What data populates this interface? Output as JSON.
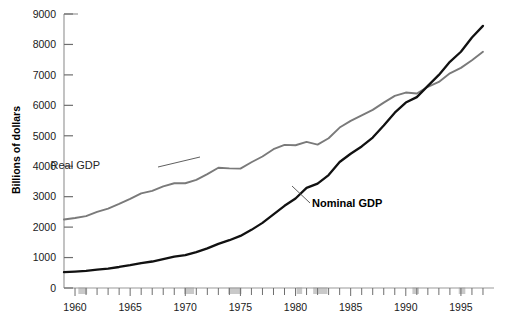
{
  "chart_data": {
    "type": "line",
    "title": "",
    "subtitle": "",
    "xlabel": "",
    "ylabel": "Billions of dollars",
    "xlim": [
      1959,
      1998
    ],
    "ylim": [
      0,
      9000
    ],
    "ytick_values": [
      0,
      1000,
      2000,
      3000,
      4000,
      5000,
      6000,
      7000,
      8000,
      9000
    ],
    "ytick_labels": [
      "0",
      "1000",
      "2000",
      "3000",
      "4000",
      "5000",
      "6000",
      "7000",
      "8000",
      "9000"
    ],
    "xtick_major_values": [
      1960,
      1965,
      1970,
      1975,
      1980,
      1985,
      1990,
      1995
    ],
    "xtick_major_labels": [
      "1960",
      "1965",
      "1970",
      "1975",
      "1980",
      "1985",
      "1990",
      "1995"
    ],
    "xtick_minor_step": 1,
    "grid": false,
    "legend_position": "inline-annotations",
    "x": [
      1959,
      1960,
      1961,
      1962,
      1963,
      1964,
      1965,
      1966,
      1967,
      1968,
      1969,
      1970,
      1971,
      1972,
      1973,
      1974,
      1975,
      1976,
      1977,
      1978,
      1979,
      1980,
      1981,
      1982,
      1983,
      1984,
      1985,
      1986,
      1987,
      1988,
      1989,
      1990,
      1991,
      1992,
      1993,
      1994,
      1995,
      1996,
      1997
    ],
    "series": [
      {
        "name": "Real GDP",
        "color": "#7a7a7a",
        "label_style": "plain",
        "values": [
          2250,
          2300,
          2360,
          2500,
          2610,
          2760,
          2930,
          3110,
          3190,
          3340,
          3440,
          3440,
          3550,
          3740,
          3950,
          3930,
          3920,
          4130,
          4320,
          4560,
          4700,
          4690,
          4800,
          4710,
          4920,
          5270,
          5490,
          5670,
          5850,
          6090,
          6310,
          6420,
          6390,
          6610,
          6770,
          7050,
          7230,
          7480,
          7760
        ]
      },
      {
        "name": "Nominal GDP",
        "color": "#111111",
        "label_style": "bold",
        "values": [
          520,
          540,
          560,
          600,
          640,
          690,
          750,
          820,
          870,
          950,
          1030,
          1080,
          1180,
          1300,
          1450,
          1570,
          1710,
          1910,
          2140,
          2420,
          2700,
          2940,
          3290,
          3430,
          3710,
          4140,
          4410,
          4650,
          4940,
          5340,
          5760,
          6090,
          6270,
          6640,
          7000,
          7430,
          7760,
          8230,
          8610
        ]
      }
    ],
    "annotations": [
      {
        "text": "Real GDP",
        "for_series": "Real GDP",
        "style": "plain",
        "text_x": 100,
        "text_y": 169,
        "leader_from": [
          158,
          167
        ],
        "leader_to": [
          200,
          157
        ]
      },
      {
        "text": "Nominal GDP",
        "for_series": "Nominal GDP",
        "style": "bold",
        "text_x": 312,
        "text_y": 207,
        "leader_from": [
          310,
          203
        ],
        "leader_to": [
          292,
          186
        ]
      }
    ],
    "recession_bands": [
      {
        "start": 1960.3,
        "end": 1961.1
      },
      {
        "start": 1969.9,
        "end": 1970.8
      },
      {
        "start": 1973.9,
        "end": 1975.1
      },
      {
        "start": 1980.1,
        "end": 1980.6
      },
      {
        "start": 1981.6,
        "end": 1982.9
      },
      {
        "start": 1990.6,
        "end": 1991.2
      },
      {
        "start": 1994.8,
        "end": 1995.4
      }
    ],
    "recession_band_color": "#c9c9c9"
  },
  "axes": {
    "frame_color": "#9a9a9a",
    "tick_color": "#6e6e6e",
    "background": "#ffffff"
  }
}
